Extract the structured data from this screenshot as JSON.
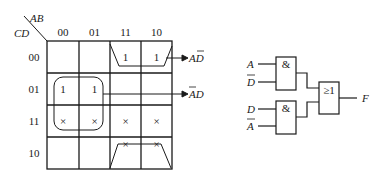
{
  "kmap": {
    "row_var": "CD",
    "col_var": "AB",
    "col_labels": [
      "00",
      "01",
      "11",
      "10"
    ],
    "row_labels": [
      "00",
      "01",
      "11",
      "10"
    ],
    "cells": [
      [
        "",
        "",
        "1",
        "1"
      ],
      [
        "1",
        "1",
        "",
        ""
      ],
      [
        "×",
        "×",
        "×",
        "×"
      ],
      [
        "",
        "",
        "×",
        "×"
      ]
    ],
    "groups": [
      {
        "label": "AD̄",
        "label_main": "AD",
        "overbar": "D"
      },
      {
        "label": "ĀD",
        "label_main": "AD",
        "overbar": "A"
      }
    ]
  },
  "circuit": {
    "gate1": {
      "symbol": "&",
      "inputs": [
        "A",
        "D̄"
      ]
    },
    "gate2": {
      "symbol": "&",
      "inputs": [
        "D",
        "Ā"
      ]
    },
    "or_gate": {
      "symbol": "≥1"
    },
    "output": "F"
  }
}
